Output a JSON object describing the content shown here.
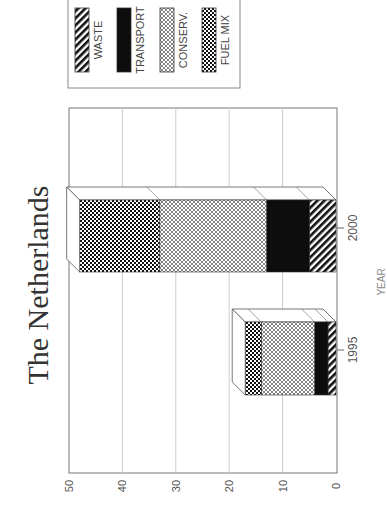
{
  "chart_data": {
    "type": "bar",
    "stacked": true,
    "orientation": "rotated-90-ccw",
    "title": "The Netherlands",
    "xlabel": "YEAR",
    "ylabel": "",
    "categories": [
      "1995",
      "2000"
    ],
    "series": [
      {
        "name": "WASTE",
        "pattern": "diagonal-stripes",
        "values": [
          1.5,
          5
        ]
      },
      {
        "name": "TRANSPORT",
        "pattern": "solid-black",
        "values": [
          2.5,
          8
        ]
      },
      {
        "name": "CONSERV.",
        "pattern": "fine-crosshatch",
        "values": [
          10,
          20
        ]
      },
      {
        "name": "FUEL MIX",
        "pattern": "checkerboard",
        "values": [
          3,
          15
        ]
      }
    ],
    "ylim": [
      0,
      50
    ],
    "yticks": [
      "0",
      "10",
      "20",
      "30",
      "40",
      "50"
    ],
    "grid": true,
    "legend_position": "top",
    "bar_style": "3d"
  },
  "legend": {
    "items": [
      "WASTE",
      "TRANSPORT",
      "CONSERV.",
      "FUEL MIX"
    ]
  },
  "colors": {
    "ink": "#111111",
    "grid": "#cccccc",
    "axis": "#666666"
  }
}
